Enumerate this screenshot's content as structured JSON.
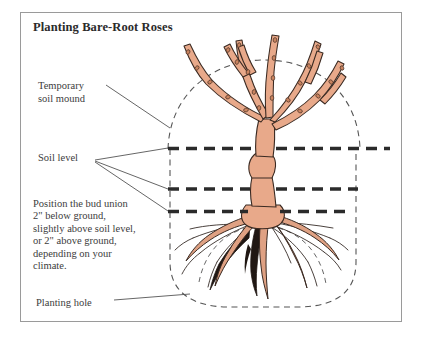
{
  "figure": {
    "title": "Planting Bare-Root Roses"
  },
  "labels": {
    "temporary_soil_mound": "Temporary\nsoil mound",
    "soil_level": "Soil level",
    "bud_union_note": "Position the bud union\n2\" below ground,\nslightly above soil level,\nor 2\" above ground,\ndepending on your\nclimate.",
    "planting_hole": "Planting hole"
  },
  "diagram_elements": {
    "soil_level_lines": [
      {
        "name": "upper-soil-level-line",
        "y": 148
      },
      {
        "name": "middle-soil-level-line",
        "y": 189
      },
      {
        "name": "lower-soil-level-line",
        "y": 212
      }
    ],
    "mound_dome": "dashed dome arc over planting hole",
    "planting_hole_outline": "dashed rounded hole outline",
    "root_mound_arc": "dashed arc under roots inside hole",
    "plant": "bare-root rose with five canes, bud union knob and spreading roots"
  },
  "colors": {
    "frame_border": "#9a9a9a",
    "background": "#ffffff",
    "cane_fill": "#e8a98a",
    "cane_outline": "#3a2a22",
    "root_fill": "#dfa183",
    "root_dark": "#201713",
    "dashed_soil_line": "#2b2b2b",
    "dashed_outline": "#555555",
    "text": "#3c3c3c",
    "title_text": "#2b2b2b"
  }
}
